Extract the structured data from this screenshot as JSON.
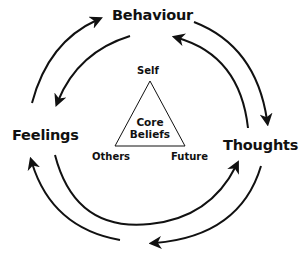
{
  "diagram": {
    "type": "cycle",
    "nodes": {
      "top": "Behaviour",
      "left": "Feelings",
      "right": "Thoughts"
    },
    "center": {
      "shape": "triangle",
      "label_line1": "Core",
      "label_line2": "Beliefs",
      "vertices": {
        "top": "Self",
        "bottom_left": "Others",
        "bottom_right": "Future"
      }
    },
    "edges": [
      {
        "from": "Feelings",
        "to": "Behaviour"
      },
      {
        "from": "Behaviour",
        "to": "Feelings"
      },
      {
        "from": "Behaviour",
        "to": "Thoughts"
      },
      {
        "from": "Thoughts",
        "to": "Behaviour"
      },
      {
        "from": "Feelings",
        "to": "Thoughts"
      },
      {
        "from": "Thoughts",
        "to": "Feelings"
      }
    ],
    "colors": {
      "line": "#111111",
      "background": "#ffffff"
    }
  }
}
